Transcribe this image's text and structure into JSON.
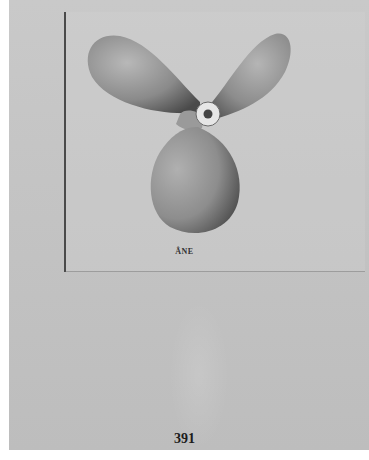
{
  "page": {
    "caption": "ÂNE",
    "page_number": "391",
    "illustration": "three-blade-propeller"
  },
  "colors": {
    "paper": "#c6c6c6",
    "ink": "#1c1c1c",
    "border": "#ffffff"
  }
}
